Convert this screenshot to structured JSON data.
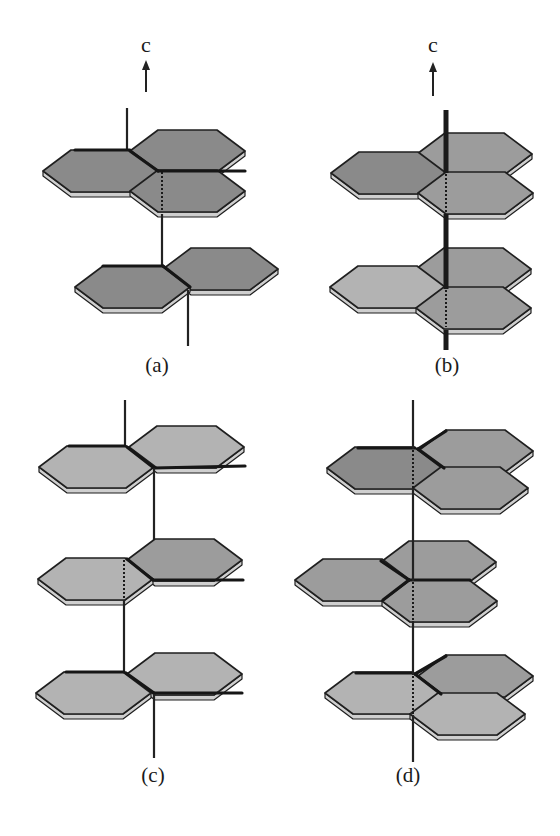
{
  "figure": {
    "axis_label": "c",
    "panels": [
      {
        "id": "a",
        "label": "(a)"
      },
      {
        "id": "b",
        "label": "(b)"
      },
      {
        "id": "c",
        "label": "(c)"
      },
      {
        "id": "d",
        "label": "(d)"
      }
    ]
  },
  "colors": {
    "background": "#ffffff",
    "hex_fill_dark": "#8a8a8a",
    "hex_fill_mid": "#9c9c9c",
    "hex_fill_light": "#b3b3b3",
    "edge": "#1f1f1f"
  }
}
